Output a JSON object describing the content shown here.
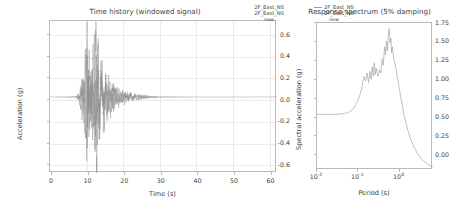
{
  "figure": {
    "background": "#ffffff",
    "line_color": "#8e8e8e"
  },
  "panels": [
    {
      "name": "time-history",
      "title": "Time history (windowed signal)",
      "xlabel": "Time (s)",
      "ylabel": "Acceleration (g)",
      "legend": [
        "2F_East_NS",
        "2F_East_NS"
      ],
      "legend_sub": "new",
      "xticks": [
        "0",
        "10",
        "20",
        "30",
        "40",
        "50",
        "60"
      ],
      "yticks": [
        "0.6",
        "0.4",
        "0.2",
        "0.0",
        "-0.2",
        "-0.4",
        "-0.6"
      ]
    },
    {
      "name": "response-spectrum",
      "title": "Response spectrum (5% damping)",
      "xlabel": "Period (s)",
      "ylabel": "Spectral acceleration (g)",
      "legend": [
        "2F_East_NS",
        "2F_East_NS"
      ],
      "legend_sub": "new",
      "xticks": [
        "10",
        "10",
        "10"
      ],
      "xtick_exponents": [
        "-2",
        "-1",
        "0"
      ],
      "yticks": [
        "1.75",
        "1.50",
        "1.25",
        "1.00",
        "0.75",
        "0.50",
        "0.25",
        "0.00"
      ]
    }
  ],
  "chart_data": [
    {
      "type": "line",
      "name": "time-history",
      "title": "Time history (windowed signal)",
      "xlabel": "Time (s)",
      "ylabel": "Acceleration (g)",
      "xlim": [
        0,
        62
      ],
      "ylim": [
        -0.72,
        0.72
      ],
      "xticks": [
        0,
        10,
        20,
        30,
        40,
        50,
        60
      ],
      "yticks": [
        -0.6,
        -0.4,
        -0.2,
        0.0,
        0.2,
        0.4,
        0.6
      ],
      "grid": true,
      "legend": [
        "2F_East_NS",
        "2F_East_NS",
        "new"
      ],
      "legend_position": "upper right",
      "description": "Seismic accelerogram; quiescent until ~7.5 s, strong motion burst 8-20 s with peak positive 0.68 g near t=12.8 s and peak negative -0.55 g near t=10.2 s, decaying coda to ~27 s, flat thereafter to 60 s.",
      "peak_positive_g": 0.68,
      "peak_negative_g": -0.55,
      "strong_motion_window_s": [
        8.0,
        20.0
      ],
      "series": [
        {
          "name": "2F_East_NS",
          "envelope_t": [
            0,
            7.0,
            7.8,
            8.4,
            9.0,
            9.6,
            10.2,
            10.8,
            11.4,
            12.0,
            12.6,
            13.2,
            13.8,
            14.5,
            15.2,
            16.0,
            17.0,
            18.0,
            19.0,
            20.0,
            21.5,
            23.0,
            25.0,
            27.0,
            30.0,
            40.0,
            50.0,
            60.0
          ],
          "envelope_amp": [
            0.0,
            0.004,
            0.03,
            0.1,
            0.22,
            0.3,
            0.56,
            0.33,
            0.3,
            0.4,
            0.68,
            0.36,
            0.26,
            0.22,
            0.17,
            0.14,
            0.11,
            0.085,
            0.06,
            0.045,
            0.035,
            0.025,
            0.015,
            0.008,
            0.003,
            0.001,
            0.001,
            0.0
          ]
        }
      ]
    },
    {
      "type": "line",
      "name": "response-spectrum",
      "title": "Response spectrum (5% damping)",
      "xlabel": "Period (s)",
      "ylabel": "Spectral acceleration (g)",
      "xscale": "log",
      "xlim": [
        0.007,
        5.0
      ],
      "ylim": [
        0.0,
        1.85
      ],
      "xticks": [
        0.01,
        0.1,
        1.0
      ],
      "xticklabels": [
        "10^-2",
        "10^-1",
        "10^0"
      ],
      "yticks": [
        0.0,
        0.25,
        0.5,
        0.75,
        1.0,
        1.25,
        1.5,
        1.75
      ],
      "grid": false,
      "legend": [
        "2F_East_NS",
        "2F_East_NS",
        "new"
      ],
      "legend_position": "upper left",
      "description": "5% damped response spectrum: flat plateau near 0.70 g for periods below 0.04 s, rising through 1.0 g at ~0.1 s, jagged amplified band 1.0-1.35 g from 0.09-0.2 s, maximum 1.78 g near 0.42 s, then steep decay to 0.05 g at 4 s.",
      "peak_sa_g": 1.78,
      "peak_period_s": 0.42,
      "pga_plateau_g": 0.7,
      "series": [
        {
          "name": "2F_East_NS",
          "period_s": [
            0.007,
            0.01,
            0.015,
            0.02,
            0.03,
            0.04,
            0.05,
            0.06,
            0.07,
            0.08,
            0.09,
            0.1,
            0.11,
            0.12,
            0.13,
            0.14,
            0.15,
            0.16,
            0.17,
            0.18,
            0.19,
            0.2,
            0.22,
            0.24,
            0.26,
            0.28,
            0.3,
            0.32,
            0.34,
            0.36,
            0.38,
            0.4,
            0.42,
            0.44,
            0.46,
            0.48,
            0.5,
            0.55,
            0.6,
            0.7,
            0.8,
            0.9,
            1.0,
            1.2,
            1.5,
            2.0,
            2.5,
            3.0,
            4.0,
            5.0
          ],
          "sa_g": [
            0.7,
            0.7,
            0.7,
            0.7,
            0.71,
            0.72,
            0.75,
            0.8,
            0.87,
            0.95,
            1.05,
            1.18,
            1.12,
            1.22,
            1.1,
            1.24,
            1.14,
            1.3,
            1.18,
            1.35,
            1.2,
            1.28,
            1.18,
            1.26,
            1.22,
            1.4,
            1.32,
            1.55,
            1.45,
            1.62,
            1.5,
            1.72,
            1.78,
            1.6,
            1.66,
            1.48,
            1.55,
            1.38,
            1.3,
            1.1,
            0.92,
            0.78,
            0.66,
            0.5,
            0.35,
            0.22,
            0.15,
            0.11,
            0.06,
            0.04
          ]
        }
      ]
    }
  ]
}
